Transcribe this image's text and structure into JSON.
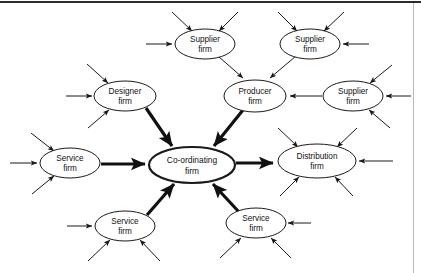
{
  "diagram": {
    "type": "network-hub-and-spoke",
    "title": "",
    "canvas": {
      "width": 421,
      "height": 273
    },
    "colors": {
      "node_fill": "#ffffff",
      "node_stroke": "#1a1a1a",
      "bold_edge": "#111111",
      "thin_edge": "#1a1a1a",
      "frame_top": "#2b2b2b",
      "frame_right": "#b9b9b9",
      "text": "#111111"
    },
    "nodes": [
      {
        "id": "coordinating",
        "label_line1": "Co-ordinating",
        "label_line2": "firm",
        "cx": 192,
        "cy": 165,
        "rx": 43,
        "ry": 18,
        "emphasis": "bold"
      },
      {
        "id": "supplier-top-left",
        "label_line1": "Supplier",
        "label_line2": "firm",
        "cx": 205,
        "cy": 44,
        "rx": 30,
        "ry": 15,
        "emphasis": "normal"
      },
      {
        "id": "supplier-top-right",
        "label_line1": "Supplier",
        "label_line2": "firm",
        "cx": 310,
        "cy": 44,
        "rx": 30,
        "ry": 15,
        "emphasis": "normal"
      },
      {
        "id": "supplier-right",
        "label_line1": "Supplier",
        "label_line2": "firm",
        "cx": 353,
        "cy": 96,
        "rx": 30,
        "ry": 15,
        "emphasis": "normal"
      },
      {
        "id": "producer",
        "label_line1": "Producer",
        "label_line2": "firm",
        "cx": 255,
        "cy": 96,
        "rx": 31,
        "ry": 16,
        "emphasis": "normal"
      },
      {
        "id": "designer",
        "label_line1": "Designer",
        "label_line2": "firm",
        "cx": 125,
        "cy": 96,
        "rx": 31,
        "ry": 15,
        "emphasis": "normal"
      },
      {
        "id": "service-left",
        "label_line1": "Service",
        "label_line2": "firm",
        "cx": 70,
        "cy": 163,
        "rx": 30,
        "ry": 15,
        "emphasis": "normal"
      },
      {
        "id": "distribution",
        "label_line1": "Distribution",
        "label_line2": "firm",
        "cx": 317,
        "cy": 161,
        "rx": 39,
        "ry": 17,
        "emphasis": "normal"
      },
      {
        "id": "service-bottom-left",
        "label_line1": "Service",
        "label_line2": "firm",
        "cx": 125,
        "cy": 226,
        "rx": 30,
        "ry": 15,
        "emphasis": "normal"
      },
      {
        "id": "service-bottom-right",
        "label_line1": "Service",
        "label_line2": "firm",
        "cx": 256,
        "cy": 223,
        "rx": 30,
        "ry": 15,
        "emphasis": "normal"
      }
    ],
    "bold_edges": [
      {
        "from": "designer",
        "to": "coordinating"
      },
      {
        "from": "producer",
        "to": "coordinating"
      },
      {
        "from": "service-left",
        "to": "coordinating"
      },
      {
        "from": "service-bottom-left",
        "to": "coordinating"
      },
      {
        "from": "service-bottom-right",
        "to": "coordinating"
      },
      {
        "from": "coordinating",
        "to": "distribution"
      }
    ],
    "thin_edges": [
      {
        "from": "supplier-top-left",
        "to": "producer"
      },
      {
        "from": "supplier-top-right",
        "to": "producer"
      },
      {
        "from": "supplier-right",
        "to": "producer"
      }
    ],
    "external_inflows": {
      "supplier-top-left": 3,
      "supplier-top-right": 3,
      "supplier-right": 3,
      "producer": 0,
      "designer": 3,
      "service-left": 3,
      "distribution": 5,
      "service-bottom-left": 3,
      "service-bottom-right": 3
    }
  }
}
